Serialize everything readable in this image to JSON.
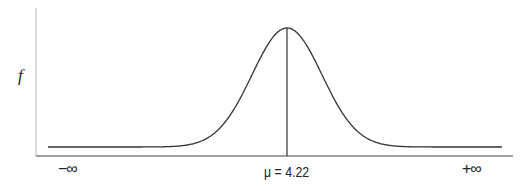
{
  "chart_data": {
    "type": "line",
    "title": "",
    "xlabel": "",
    "ylabel": "f",
    "distribution": "normal",
    "mean": 4.22,
    "x_tick_labels": [
      "−∞",
      "μ = 4.22",
      "+∞"
    ],
    "annotations": [
      {
        "type": "vertical-line",
        "at": "mean",
        "label": "μ = 4.22"
      }
    ],
    "grid": false,
    "legend": null,
    "colors": {
      "curve": "#333333",
      "axis": "#444444",
      "y_axis": "#bbbbbb"
    }
  },
  "labels": {
    "y": "f",
    "x_left": "−∞",
    "x_mid": "μ = 4.22",
    "x_right": "+∞"
  },
  "layout": {
    "peak_px": 287,
    "sigma_px": 35,
    "baseline_px": 147,
    "peak_y_px": 28,
    "curve_x_start": 48,
    "curve_x_end": 502
  }
}
